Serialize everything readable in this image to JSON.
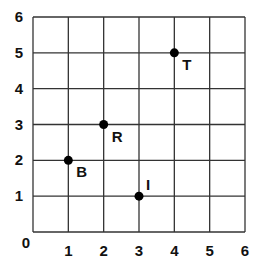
{
  "chart_data": {
    "type": "scatter",
    "title": "",
    "xlabel": "",
    "ylabel": "",
    "xlim": [
      0,
      6
    ],
    "ylim": [
      0,
      6
    ],
    "grid": true,
    "x_ticks": [
      "0",
      "1",
      "2",
      "3",
      "4",
      "5",
      "6"
    ],
    "y_ticks": [
      "1",
      "2",
      "3",
      "4",
      "5",
      "6"
    ],
    "origin_label": "0",
    "points": [
      {
        "label": "B",
        "x": 1,
        "y": 2
      },
      {
        "label": "R",
        "x": 2,
        "y": 3
      },
      {
        "label": "I",
        "x": 3,
        "y": 1
      },
      {
        "label": "T",
        "x": 4,
        "y": 5
      }
    ]
  },
  "style": {
    "grid_color": "#333333",
    "point_color": "#000000",
    "text_color": "#111111"
  }
}
